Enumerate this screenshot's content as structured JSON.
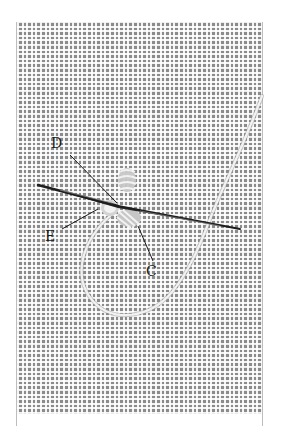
{
  "figure": {
    "labels": [
      {
        "id": "D",
        "text": "D"
      },
      {
        "id": "E",
        "text": "E"
      },
      {
        "id": "C",
        "text": "C"
      }
    ],
    "colors": {
      "background": "#ffffff",
      "fabric_thread": "#e6e6e6",
      "fabric_hole": "#7a7a7a",
      "needle": "#2a2a2a",
      "embroidery_thread": "#ececec",
      "leader_line": "#1a1a1a",
      "frame_border": "#bdbdbd"
    }
  }
}
